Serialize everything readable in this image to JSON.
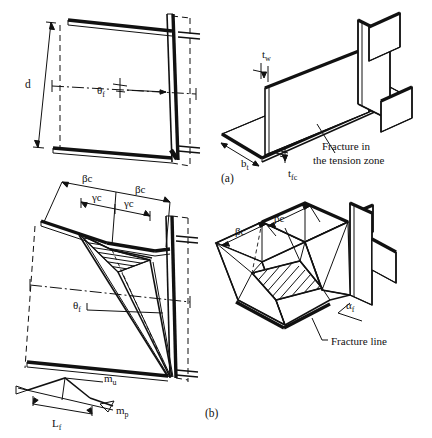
{
  "figure": {
    "title_caption_a": "(a)",
    "title_caption_b": "(b)",
    "background": "#ffffff",
    "ink_color": "#111111"
  },
  "panel_a_elevation": {
    "name": "beam-column-elevation-undeformed",
    "labels": {
      "depth": "d",
      "rotation_angle": "θ",
      "rotation_angle_sub": "f"
    }
  },
  "panel_a_isometric": {
    "name": "beam-isometric-fracture",
    "labels": {
      "web_thickness": "t",
      "web_thickness_sub": "w",
      "flange_width": "b",
      "flange_width_sub": "t",
      "flange_thickness": "t",
      "flange_thickness_sub": "fc",
      "note_line1": "Fracture in",
      "note_line2": "the tension zone",
      "caption": "(a)"
    }
  },
  "panel_b_elevation": {
    "name": "beam-column-elevation-yieldline",
    "labels": {
      "beta_c_left": "βc",
      "beta_c_right": "βc",
      "gamma_c_left": "γc",
      "gamma_c_right": "γc",
      "rotation_angle": "θ",
      "rotation_angle_sub": "f",
      "moment_ultimate": "m",
      "moment_ultimate_sub": "u",
      "moment_plastic": "m",
      "moment_plastic_sub": "p",
      "fracture_length": "L",
      "fracture_length_sub": "f"
    }
  },
  "panel_b_isometric": {
    "name": "beam-isometric-yieldline-mechanism",
    "labels": {
      "beta_c_far": "βc",
      "beta_c_near": "βc",
      "alpha_f": "α",
      "alpha_f_sub": "f",
      "fracture_line_note": "Fracture line",
      "caption": "(b)"
    }
  }
}
